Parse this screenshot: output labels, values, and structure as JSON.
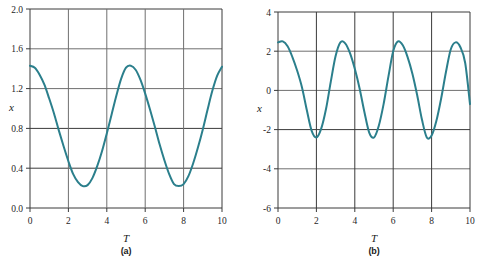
{
  "figure": {
    "panels": [
      {
        "caption": "(a)",
        "xlabel": "T",
        "ylabel": "x",
        "xticks": [
          "0",
          "2",
          "4",
          "6",
          "8",
          "10"
        ],
        "yticks": [
          "0.0",
          "0.4",
          "0.8",
          "1.2",
          "1.6",
          "2.0"
        ]
      },
      {
        "caption": "(b)",
        "xlabel": "T",
        "ylabel": "x",
        "xticks": [
          "0",
          "2",
          "4",
          "6",
          "8",
          "10"
        ],
        "yticks": [
          "-6",
          "-4",
          "-2",
          "0",
          "2",
          "4"
        ]
      }
    ]
  },
  "chart_data": [
    {
      "type": "line",
      "title": "",
      "subtitle": "(a)",
      "xlabel": "T",
      "ylabel": "x",
      "xlim": [
        0,
        10
      ],
      "ylim": [
        0.0,
        2.0
      ],
      "xticks": [
        0,
        2,
        4,
        6,
        8,
        10
      ],
      "yticks": [
        0.0,
        0.4,
        0.8,
        1.2,
        1.6,
        2.0
      ],
      "grid": true,
      "legend": null,
      "series": [
        {
          "name": "x(T)",
          "color": "#2b7f8c",
          "description": "Smooth periodic oscillation, period ~4.95, centered near 0.825 with amplitude ~0.605; maxima ~1.43 at T=0, 5.05, 10.0; minima ~0.22 at T=2.55, 7.5",
          "x": [
            0.0,
            0.25,
            0.5,
            0.75,
            1.0,
            1.25,
            1.5,
            1.75,
            2.0,
            2.25,
            2.5,
            2.75,
            3.0,
            3.25,
            3.5,
            3.75,
            4.0,
            4.25,
            4.5,
            4.75,
            5.0,
            5.25,
            5.5,
            5.75,
            6.0,
            6.25,
            6.5,
            6.75,
            7.0,
            7.25,
            7.5,
            7.75,
            8.0,
            8.25,
            8.5,
            8.75,
            9.0,
            9.25,
            9.5,
            9.75,
            10.0
          ],
          "y": [
            1.43,
            1.41,
            1.34,
            1.24,
            1.1,
            0.95,
            0.78,
            0.62,
            0.47,
            0.34,
            0.26,
            0.22,
            0.23,
            0.3,
            0.42,
            0.57,
            0.75,
            0.94,
            1.13,
            1.3,
            1.41,
            1.43,
            1.39,
            1.29,
            1.15,
            0.99,
            0.82,
            0.64,
            0.48,
            0.34,
            0.24,
            0.22,
            0.24,
            0.32,
            0.45,
            0.61,
            0.79,
            0.99,
            1.18,
            1.33,
            1.42
          ]
        }
      ]
    },
    {
      "type": "line",
      "title": "",
      "subtitle": "(b)",
      "xlabel": "T",
      "ylabel": "x",
      "xlim": [
        0,
        10
      ],
      "ylim": [
        -6,
        4
      ],
      "xticks": [
        0,
        2,
        4,
        6,
        8,
        10
      ],
      "yticks": [
        -6,
        -4,
        -2,
        0,
        2,
        4
      ],
      "grid": true,
      "legend": null,
      "series": [
        {
          "name": "x(T)",
          "color": "#2b7f8c",
          "description": "Near-sinusoidal oscillation, period ~3.05, amplitude ~2.5 about zero; maxima ~2.5 at T=0.1, 3.1, 6.05, 9.15; minima ~-2.45 at T=1.6, 4.55, 7.6",
          "x": [
            0.0,
            0.25,
            0.5,
            0.75,
            1.0,
            1.25,
            1.5,
            1.75,
            2.0,
            2.25,
            2.5,
            2.75,
            3.0,
            3.25,
            3.5,
            3.75,
            4.0,
            4.25,
            4.5,
            4.75,
            5.0,
            5.25,
            5.5,
            5.75,
            6.0,
            6.25,
            6.5,
            6.75,
            7.0,
            7.25,
            7.5,
            7.75,
            8.0,
            8.25,
            8.5,
            8.75,
            9.0,
            9.25,
            9.5,
            9.75,
            10.0
          ],
          "y": [
            2.45,
            2.5,
            2.25,
            1.7,
            1.0,
            0.15,
            -1.0,
            -2.05,
            -2.4,
            -1.95,
            -0.95,
            0.45,
            1.75,
            2.45,
            2.4,
            1.9,
            1.1,
            0.1,
            -1.1,
            -2.15,
            -2.4,
            -1.8,
            -0.7,
            0.7,
            2.0,
            2.5,
            2.3,
            1.7,
            0.85,
            -0.25,
            -1.5,
            -2.4,
            -2.3,
            -1.55,
            -0.4,
            0.95,
            2.1,
            2.45,
            2.2,
            1.4,
            -0.7
          ]
        }
      ]
    }
  ]
}
